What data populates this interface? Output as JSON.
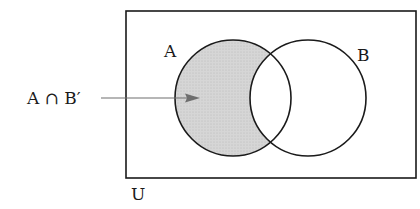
{
  "diagram": {
    "type": "venn",
    "universe_label": "U",
    "sets": [
      {
        "id": "A",
        "label": "A",
        "shaded_region": true
      },
      {
        "id": "B",
        "label": "B",
        "shaded_region": false
      }
    ],
    "shaded_region_label": "A ∩ B′",
    "colors": {
      "stroke": "#1a1a1a",
      "shade": "#d4d4d4",
      "arrow": "#6e6e6e",
      "background": "#ffffff"
    }
  }
}
